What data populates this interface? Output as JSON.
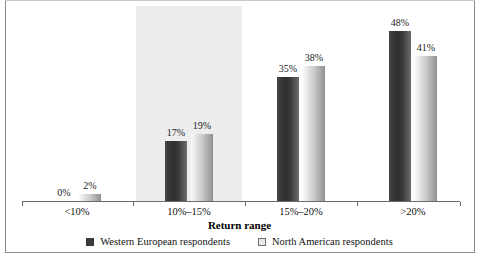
{
  "chart_data": {
    "type": "bar",
    "title": "",
    "xlabel": "Return range",
    "ylabel": "",
    "ylim": [
      0,
      55
    ],
    "grid": false,
    "legend_position": "bottom",
    "categories": [
      "<10%",
      "10%–15%",
      "15%–20%",
      ">20%"
    ],
    "series": [
      {
        "name": "Western European respondents",
        "color": "#3a3a3a",
        "values": [
          0,
          17,
          35,
          48
        ],
        "labels": [
          "0%",
          "17%",
          "35%",
          "48%"
        ]
      },
      {
        "name": "North American respondents",
        "color": "#d3d3d3",
        "values": [
          2,
          19,
          38,
          41
        ],
        "labels": [
          "2%",
          "19%",
          "38%",
          "41%"
        ]
      }
    ],
    "annotations": {
      "highlight_band_category": "10%–15%",
      "highlight_band_color": "#ededed"
    }
  },
  "legend": {
    "items": [
      {
        "label": "Western European respondents",
        "swatch": "dark"
      },
      {
        "label": "North American respondents",
        "swatch": "light"
      }
    ]
  }
}
